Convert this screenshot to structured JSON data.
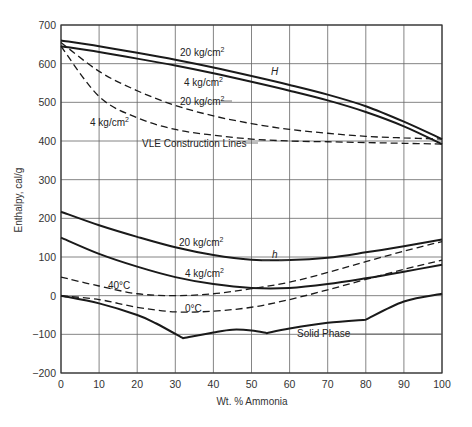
{
  "chart_data": {
    "type": "line",
    "title": "",
    "xlabel": "Wt. % Ammonia",
    "ylabel": "Enthalpy, cal/g",
    "xlim": [
      0,
      100
    ],
    "ylim": [
      -200,
      700
    ],
    "grid": true,
    "x_ticks": [
      "0",
      "10",
      "20",
      "30",
      "40",
      "50",
      "60",
      "70",
      "80",
      "90",
      "100"
    ],
    "y_ticks": [
      "700",
      "600",
      "500",
      "400",
      "300",
      "200",
      "100",
      "0",
      "-100",
      "-200"
    ],
    "series": [
      {
        "name": "H 20 kg/cm2 (saturated vapor)",
        "style": "solid",
        "x": [
          0,
          10,
          20,
          30,
          40,
          50,
          60,
          70,
          80,
          90,
          100
        ],
        "y": [
          660,
          645,
          628,
          610,
          590,
          568,
          545,
          520,
          490,
          450,
          405
        ]
      },
      {
        "name": "H 4 kg/cm2 (saturated vapor)",
        "style": "solid",
        "x": [
          0,
          10,
          20,
          30,
          40,
          50,
          60,
          70,
          80,
          90,
          100
        ],
        "y": [
          645,
          630,
          613,
          595,
          575,
          553,
          530,
          505,
          475,
          438,
          392
        ]
      },
      {
        "name": "20 kg/cm2 VLE construction line",
        "style": "dashed",
        "x": [
          0,
          10,
          20,
          30,
          40,
          50,
          60,
          70,
          80,
          90,
          100
        ],
        "y": [
          655,
          580,
          530,
          492,
          465,
          445,
          430,
          420,
          412,
          408,
          405
        ]
      },
      {
        "name": "4 kg/cm2 VLE construction line",
        "style": "dashed",
        "x": [
          0,
          10,
          20,
          30,
          40,
          50,
          60,
          70,
          80,
          90,
          100
        ],
        "y": [
          645,
          515,
          460,
          430,
          415,
          405,
          400,
          398,
          396,
          394,
          392
        ]
      },
      {
        "name": "h 20 kg/cm2 (saturated liquid)",
        "style": "solid",
        "x": [
          0,
          10,
          20,
          30,
          40,
          50,
          60,
          70,
          80,
          90,
          100
        ],
        "y": [
          217,
          182,
          152,
          125,
          105,
          93,
          92,
          98,
          112,
          128,
          145
        ]
      },
      {
        "name": "h 4 kg/cm2 (saturated liquid)",
        "style": "solid",
        "x": [
          0,
          10,
          20,
          30,
          40,
          50,
          60,
          70,
          80,
          90,
          100
        ],
        "y": [
          150,
          108,
          75,
          48,
          30,
          20,
          20,
          30,
          45,
          62,
          80
        ]
      },
      {
        "name": "40°C",
        "style": "dashed",
        "x": [
          0,
          10,
          20,
          30,
          40,
          50,
          60,
          70,
          80,
          90,
          100
        ],
        "y": [
          48,
          25,
          5,
          0,
          5,
          18,
          35,
          60,
          88,
          115,
          140
        ]
      },
      {
        "name": "0°C",
        "style": "dashed",
        "x": [
          0,
          10,
          20,
          30,
          40,
          50,
          60,
          70,
          80,
          90,
          100
        ],
        "y": [
          0,
          -10,
          -30,
          -42,
          -40,
          -30,
          -10,
          15,
          42,
          68,
          92
        ]
      },
      {
        "name": "Solid Phase",
        "style": "solid",
        "x": [
          0,
          10,
          20,
          25,
          32,
          40,
          45,
          50,
          54,
          60,
          70,
          80,
          90,
          100
        ],
        "y": [
          0,
          -20,
          -50,
          -72,
          -110,
          -95,
          -88,
          -90,
          -97,
          -85,
          -70,
          -62,
          -15,
          5
        ]
      }
    ],
    "annotations": [
      "20 kg/cm²",
      "4 kg/cm²",
      "H",
      "20 kg/cm²",
      "4 kg/cm²",
      "VLE Construction Lines",
      "20 kg/cm²",
      "h",
      "4 kg/cm²",
      "40°C",
      "0°C",
      "Solid Phase"
    ]
  },
  "labels": {
    "ylabel": "Enthalpy, cal/g",
    "xlabel": "Wt. % Ammonia",
    "upper_20": "20 kg/cm",
    "upper_4": "4 kg/cm",
    "H": "H",
    "dash_20": "20 kg/cm",
    "dash_4": "4 kg/cm",
    "vle": "VLE Construction Lines",
    "lower_20": "20 kg/cm",
    "h": "h",
    "lower_4": "4 kg/cm",
    "t40": "40°C",
    "t0": "0°C",
    "solid": "Solid Phase",
    "sup": "2"
  }
}
